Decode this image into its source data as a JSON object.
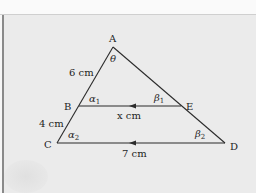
{
  "diagram": {
    "type": "similar-triangles",
    "vertices": {
      "A": {
        "label": "A",
        "x": 113,
        "y": 47
      },
      "B": {
        "label": "B",
        "x": 79,
        "y": 106
      },
      "E": {
        "label": "E",
        "x": 181,
        "y": 106
      },
      "C": {
        "label": "C",
        "x": 57,
        "y": 143
      },
      "D": {
        "label": "D",
        "x": 225,
        "y": 143
      }
    },
    "segments": [
      {
        "from": "A",
        "to": "C"
      },
      {
        "from": "A",
        "to": "D"
      },
      {
        "from": "B",
        "to": "E",
        "arrow": "parallel-mark"
      },
      {
        "from": "C",
        "to": "D",
        "arrow": "parallel-mark"
      }
    ],
    "lengths": {
      "AB": "6 cm",
      "BC": "4 cm",
      "BE": "x cm",
      "CD": "7 cm"
    },
    "angles": {
      "A": {
        "symbol": "θ",
        "sub": ""
      },
      "B": {
        "symbol": "α",
        "sub": "1"
      },
      "E": {
        "symbol": "β",
        "sub": "1"
      },
      "C": {
        "symbol": "α",
        "sub": "2"
      },
      "D": {
        "symbol": "β",
        "sub": "2"
      }
    },
    "colors": {
      "background": "#ebebeb",
      "line": "#2b2b2b",
      "text": "#1e1e1e"
    }
  }
}
